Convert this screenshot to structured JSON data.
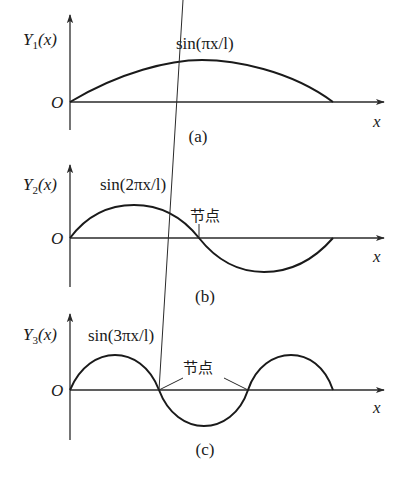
{
  "panels": [
    {
      "id": "a",
      "caption": "(a)",
      "y_label": {
        "main": "Y",
        "sub": "1",
        "arg": "(x)"
      },
      "origin_label": "O",
      "x_label": "x",
      "curve_label": "sin(πx/l)",
      "mode": 1,
      "node_label": ""
    },
    {
      "id": "b",
      "caption": "(b)",
      "y_label": {
        "main": "Y",
        "sub": "2",
        "arg": "(x)"
      },
      "origin_label": "O",
      "x_label": "x",
      "curve_label": "sin(2πx/l)",
      "mode": 2,
      "node_label": "节点"
    },
    {
      "id": "c",
      "caption": "(c)",
      "y_label": {
        "main": "Y",
        "sub": "3",
        "arg": "(x)"
      },
      "origin_label": "O",
      "x_label": "x",
      "curve_label": "sin(3πx/l)",
      "mode": 3,
      "node_label": "节点"
    }
  ]
}
